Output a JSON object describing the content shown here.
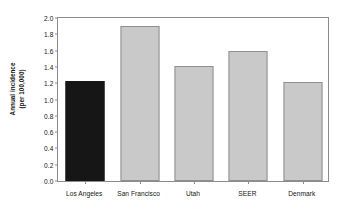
{
  "chart_data": {
    "type": "bar",
    "title": "",
    "xlabel": "",
    "ylabel": "Annual incidence (per 100,000)",
    "ylabel_line1": "Annual incidence",
    "ylabel_line2": "(per 100,000)",
    "categories": [
      "Los Angeles",
      "San Francisco",
      "Utah",
      "SEER",
      "Denmark"
    ],
    "values": [
      1.23,
      1.9,
      1.41,
      1.6,
      1.21
    ],
    "ylim": [
      0.0,
      2.0
    ],
    "yticks": [
      "0.0",
      "0.2",
      "0.4",
      "0.6",
      "0.8",
      "1.0",
      "1.2",
      "1.4",
      "1.6",
      "1.8",
      "2.0"
    ],
    "ytick_values": [
      0.0,
      0.2,
      0.4,
      0.6,
      0.8,
      1.0,
      1.2,
      1.4,
      1.6,
      1.8,
      2.0
    ],
    "grid": false,
    "legend": "none",
    "bar_colors": [
      "#161616",
      "#c9c9c9",
      "#c9c9c9",
      "#c9c9c9",
      "#c9c9c9"
    ],
    "bar_border_colors": [
      "#161616",
      "#8f8f8f",
      "#8f8f8f",
      "#8f8f8f",
      "#8f8f8f"
    ],
    "frame_color": "#8c8c8c",
    "background": "#ffffff"
  }
}
